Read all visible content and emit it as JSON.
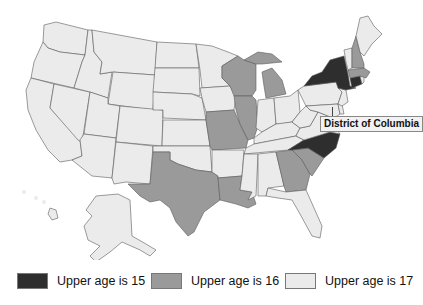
{
  "title": "",
  "colors": {
    "age15": "#2e2e2e",
    "age16": "#9a9a9a",
    "age17": "#ebebeb",
    "border": "#5a5a5a"
  },
  "callout": {
    "label": "District of Columbia"
  },
  "legend": [
    {
      "key": "age15",
      "label": "Upper age is 15",
      "color": "#2e2e2e"
    },
    {
      "key": "age16",
      "label": "Upper age is 16",
      "color": "#9a9a9a"
    },
    {
      "key": "age17",
      "label": "Upper age is 17",
      "color": "#ebebeb"
    }
  ],
  "states": {
    "age15": [
      "New York",
      "Connecticut",
      "North Carolina"
    ],
    "age16": [
      "Wisconsin",
      "Michigan",
      "Illinois",
      "Missouri",
      "Texas",
      "Louisiana",
      "Georgia",
      "South Carolina",
      "New Hampshire",
      "Massachusetts"
    ],
    "age17": [
      "Washington",
      "Oregon",
      "California",
      "Nevada",
      "Idaho",
      "Montana",
      "Wyoming",
      "Utah",
      "Arizona",
      "Colorado",
      "New Mexico",
      "North Dakota",
      "South Dakota",
      "Nebraska",
      "Kansas",
      "Oklahoma",
      "Minnesota",
      "Iowa",
      "Arkansas",
      "Mississippi",
      "Alabama",
      "Tennessee",
      "Kentucky",
      "Indiana",
      "Ohio",
      "West Virginia",
      "Virginia",
      "Pennsylvania",
      "Maryland",
      "Delaware",
      "New Jersey",
      "Vermont",
      "Maine",
      "Rhode Island",
      "Florida",
      "Alaska",
      "Hawaii",
      "District of Columbia"
    ]
  }
}
